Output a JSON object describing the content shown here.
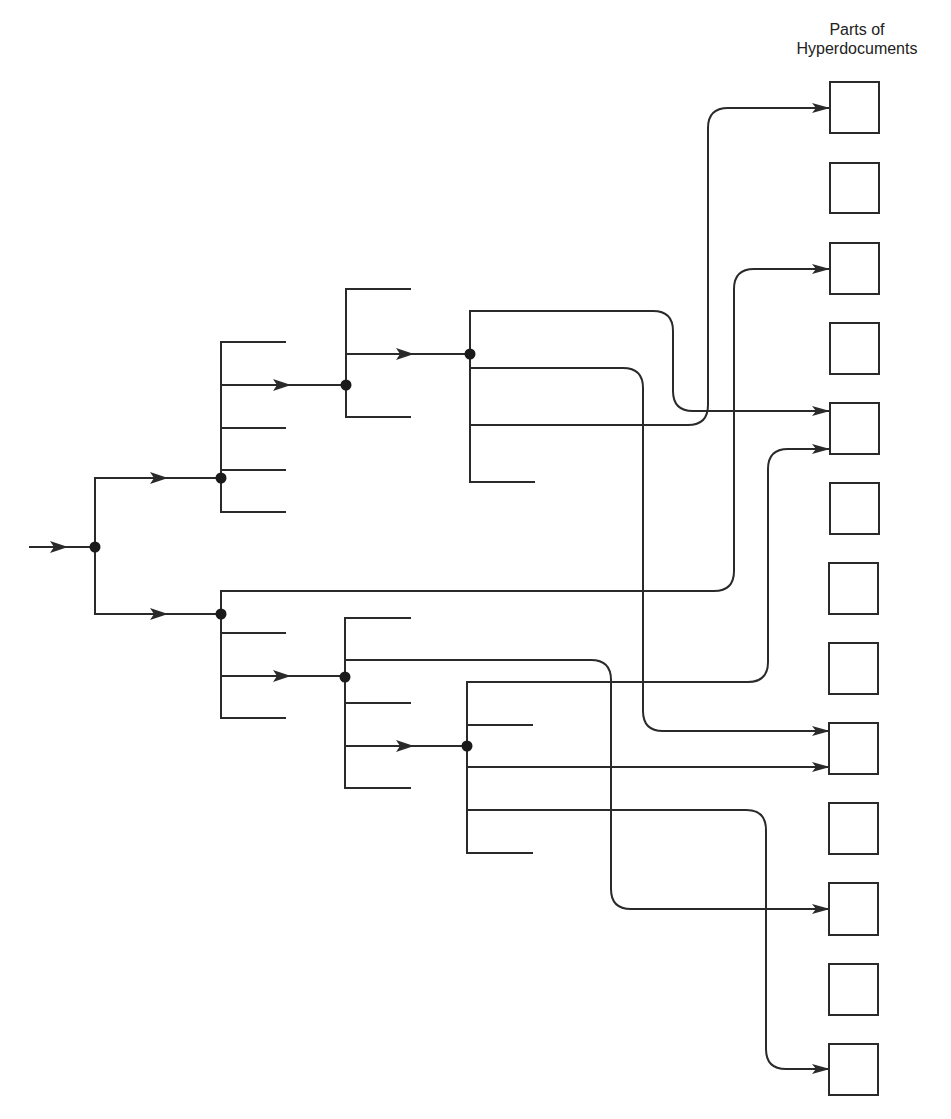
{
  "caption": {
    "line1": "Parts of",
    "line2": "Hyperdocuments"
  },
  "colors": {
    "stroke": "#2a2a2a",
    "background": "#ffffff"
  },
  "diagram": {
    "type": "hypertext-link-tree",
    "root": {
      "x": 95,
      "y": 547
    },
    "target_boxes": {
      "count": 13,
      "x": 829,
      "width": 50,
      "height": 51,
      "tops": [
        82,
        163,
        243,
        323,
        403,
        483,
        563,
        643,
        723,
        803,
        883,
        964,
        1044
      ],
      "linked": [
        1,
        3,
        5,
        9,
        11,
        13
      ],
      "unlinked": [
        2,
        4,
        6,
        7,
        8,
        10,
        12
      ]
    },
    "nodes": [
      {
        "id": "root",
        "x": 95,
        "y": 547
      },
      {
        "id": "A",
        "x": 221,
        "y": 478
      },
      {
        "id": "B",
        "x": 346,
        "y": 385
      },
      {
        "id": "C",
        "x": 470,
        "y": 354
      },
      {
        "id": "D",
        "x": 221,
        "y": 614
      },
      {
        "id": "E",
        "x": 345,
        "y": 677
      },
      {
        "id": "F",
        "x": 467,
        "y": 746
      }
    ],
    "links": [
      {
        "from": "C",
        "to_box": 5
      },
      {
        "from": "C",
        "to_box": 9
      },
      {
        "from": "C",
        "to_box": 1
      },
      {
        "from": "D",
        "to_box": 3
      },
      {
        "from": "E",
        "to_box": 11
      },
      {
        "from": "F",
        "to_box": 5
      },
      {
        "from": "F",
        "to_box": 9
      },
      {
        "from": "F",
        "to_box": 13
      }
    ]
  }
}
